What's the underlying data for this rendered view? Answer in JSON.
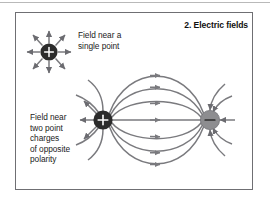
{
  "figure": {
    "title": "2. Electric fields",
    "labels": {
      "single_point": "Field near a\nsingle point",
      "dipole": "Field near\ntwo point\ncharges\nof opposite\npolarity"
    },
    "charges": {
      "single": {
        "sign": "+",
        "fill": "#2b2b2b",
        "glyph": "plus-sign"
      },
      "positive": {
        "sign": "+",
        "fill": "#2b2b2b",
        "glyph": "plus-sign"
      },
      "negative": {
        "sign": "−",
        "fill": "#8d8d90",
        "glyph": "minus-sign"
      }
    },
    "colors": {
      "frame_border": "#6f6f73",
      "field_line": "#7a7a7e",
      "background": "#ffffff",
      "text": "#1b1b1b",
      "top_rule": "#b9b9b9"
    },
    "field_lines": {
      "single_point_ray_count": 8,
      "dipole_connecting_line_count": 7,
      "dipole_escaping_line_count": 8
    }
  }
}
